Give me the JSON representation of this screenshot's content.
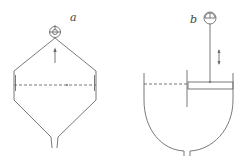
{
  "figure": {
    "panels": [
      {
        "id": "a",
        "label": "a",
        "description": "Conical-top vessel with gauge at apex, liquid level (dashed) and conical bottom outlet"
      },
      {
        "id": "b",
        "label": "b",
        "description": "Round-bottom vessel with float on stem connected to gauge, liquid level (dashed)"
      }
    ],
    "colors": {
      "line": "#6a6a6a",
      "background": "#ffffff"
    }
  }
}
